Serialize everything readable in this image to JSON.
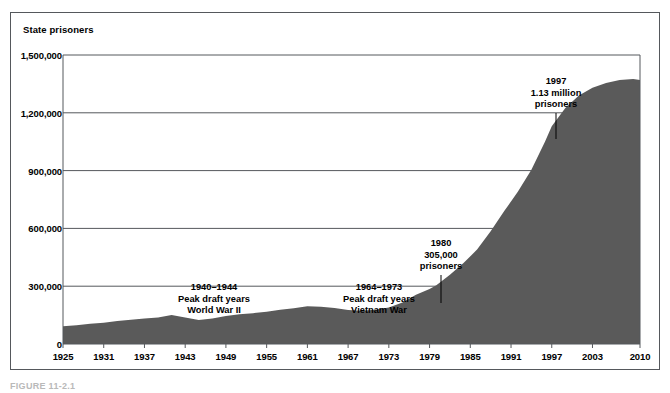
{
  "figure": {
    "caption": "FIGURE 11-2.1",
    "y_axis_title": "State prisoners"
  },
  "chart_data": {
    "type": "area",
    "title": "",
    "subtitle": "",
    "xlabel": "",
    "ylabel": "State prisoners",
    "xlim": [
      1925,
      2010
    ],
    "ylim": [
      0,
      1500000
    ],
    "grid": true,
    "grid_axis": "y",
    "legend": "none",
    "fill_color": "#5a5a5a",
    "ytick_labels": [
      "0",
      "300,000",
      "600,000",
      "900,000",
      "1,200,000",
      "1,500,000"
    ],
    "ytick_values": [
      0,
      300000,
      600000,
      900000,
      1200000,
      1500000
    ],
    "xtick_labels": [
      "1925",
      "1931",
      "1937",
      "1943",
      "1949",
      "1955",
      "1961",
      "1967",
      "1973",
      "1979",
      "1985",
      "1991",
      "1997",
      "2003",
      "2010"
    ],
    "xtick_values": [
      1925,
      1931,
      1937,
      1943,
      1949,
      1955,
      1961,
      1967,
      1973,
      1979,
      1985,
      1991,
      1997,
      2003,
      2010
    ],
    "x": [
      1925,
      1927,
      1929,
      1931,
      1933,
      1935,
      1937,
      1939,
      1941,
      1943,
      1945,
      1947,
      1949,
      1951,
      1953,
      1955,
      1957,
      1959,
      1961,
      1963,
      1965,
      1967,
      1969,
      1971,
      1973,
      1975,
      1977,
      1979,
      1980,
      1982,
      1984,
      1986,
      1988,
      1990,
      1992,
      1994,
      1996,
      1997,
      1999,
      2001,
      2003,
      2005,
      2007,
      2009,
      2010
    ],
    "values": [
      92000,
      97000,
      105000,
      110000,
      120000,
      126000,
      132000,
      138000,
      150000,
      137000,
      125000,
      132000,
      145000,
      155000,
      160000,
      168000,
      178000,
      186000,
      196000,
      193000,
      187000,
      176000,
      172000,
      178000,
      190000,
      215000,
      255000,
      285000,
      305000,
      360000,
      420000,
      490000,
      585000,
      690000,
      790000,
      905000,
      1050000,
      1130000,
      1225000,
      1290000,
      1330000,
      1355000,
      1370000,
      1375000,
      1370000
    ],
    "annotations": [
      {
        "id": "wwii",
        "lines": [
          "1940–1944",
          "Peak draft years",
          "World War II"
        ],
        "x_px": 214,
        "y_px": 282,
        "has_leader": false
      },
      {
        "id": "vietnam",
        "lines": [
          "1964–1973",
          "Peak draft years",
          "Vietnam War"
        ],
        "x_px": 379,
        "y_px": 282,
        "has_leader": false
      },
      {
        "id": "y1980",
        "lines": [
          "1980",
          "305,000",
          "prisoners"
        ],
        "x_px": 441,
        "y_px": 238,
        "has_leader": true,
        "leader_from_y": 275,
        "leader_to_y": 303
      },
      {
        "id": "y1997",
        "lines": [
          "1997",
          "1.13 million",
          "prisoners"
        ],
        "x_px": 556,
        "y_px": 76,
        "has_leader": true,
        "leader_from_y": 113,
        "leader_to_y": 139
      }
    ]
  }
}
